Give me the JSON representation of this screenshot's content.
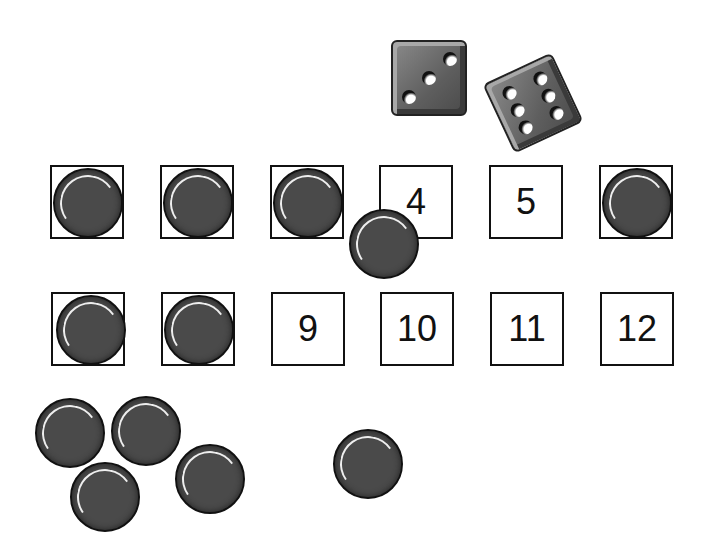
{
  "game": {
    "dice": [
      {
        "value": 3
      },
      {
        "value": 6
      }
    ],
    "board": {
      "row1": [
        "1",
        "2",
        "3",
        "4",
        "5",
        "6"
      ],
      "row2": [
        "7",
        "8",
        "9",
        "10",
        "11",
        "12"
      ],
      "covered": [
        "1",
        "2",
        "3",
        "6",
        "7",
        "8"
      ]
    },
    "labels": {
      "c4": "4",
      "c5": "5",
      "c9": "9",
      "c10": "10",
      "c11": "11",
      "c12": "12"
    },
    "loose_chips": 6
  }
}
